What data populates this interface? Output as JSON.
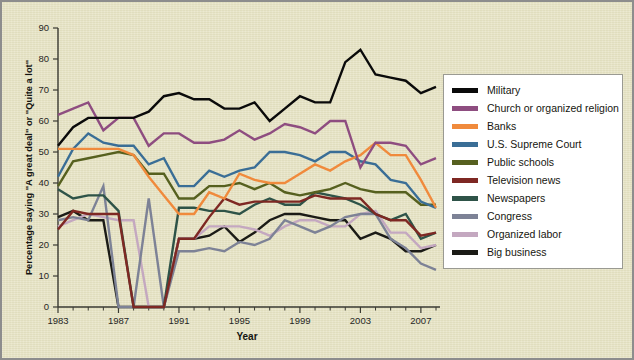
{
  "figure": {
    "background_color": "#e7e4c4",
    "frame_color": "#8d8d8d"
  },
  "chart_data": {
    "type": "line",
    "title": "",
    "xlabel": "Year",
    "ylabel": "Percentage saying \"A great deal\" or \"Quite a lot\"",
    "xlim": [
      1983,
      2008
    ],
    "ylim": [
      0,
      90
    ],
    "ytick_step": 10,
    "yticks": [
      0,
      10,
      20,
      30,
      40,
      50,
      60,
      70,
      80,
      90
    ],
    "xticks_major": [
      1983,
      1987,
      1991,
      1995,
      1999,
      2003,
      2007
    ],
    "xticks_minor_step": 1,
    "grid": false,
    "legend_position": "right",
    "x": [
      1983,
      1984,
      1985,
      1986,
      1987,
      1988,
      1989,
      1990,
      1991,
      1992,
      1993,
      1994,
      1995,
      1996,
      1997,
      1998,
      1999,
      2000,
      2001,
      2002,
      2003,
      2004,
      2005,
      2006,
      2007,
      2008
    ],
    "series": [
      {
        "name": "Military",
        "color": "#0a0a0a",
        "values": [
          52,
          58,
          61,
          61,
          61,
          61,
          63,
          68,
          69,
          67,
          67,
          64,
          64,
          66,
          60,
          64,
          68,
          66,
          66,
          79,
          83,
          75,
          74,
          73,
          69,
          71
        ]
      },
      {
        "name": "Church or organized religion",
        "color": "#8e4d80",
        "values": [
          62,
          64,
          66,
          57,
          61,
          61,
          52,
          56,
          56,
          53,
          53,
          54,
          57,
          54,
          56,
          59,
          58,
          56,
          60,
          60,
          45,
          53,
          53,
          52,
          46,
          48
        ]
      },
      {
        "name": "Banks",
        "color": "#f08a3c",
        "values": [
          51,
          51,
          51,
          51,
          51,
          49,
          42,
          36,
          30,
          30,
          37,
          35,
          43,
          41,
          40,
          40,
          43,
          46,
          44,
          47,
          49,
          53,
          49,
          49,
          41,
          32
        ]
      },
      {
        "name": "U.S. Supreme Court",
        "color": "#3a6e96",
        "values": [
          42,
          51,
          56,
          53,
          52,
          52,
          46,
          48,
          39,
          39,
          44,
          42,
          44,
          45,
          50,
          50,
          49,
          47,
          50,
          50,
          47,
          46,
          41,
          40,
          34,
          32
        ]
      },
      {
        "name": "Public schools",
        "color": "#56601f",
        "values": [
          39,
          47,
          48,
          49,
          50,
          49,
          43,
          43,
          35,
          35,
          39,
          39,
          40,
          38,
          40,
          37,
          36,
          37,
          38,
          40,
          38,
          37,
          37,
          37,
          33,
          33
        ]
      },
      {
        "name": "Television news",
        "color": "#7e2823",
        "values": [
          25,
          31,
          30,
          30,
          30,
          0,
          0,
          0,
          22,
          22,
          29,
          35,
          33,
          34,
          34,
          34,
          34,
          36,
          35,
          35,
          35,
          30,
          28,
          28,
          23,
          24
        ]
      },
      {
        "name": "Newspapers",
        "color": "#2e5348",
        "values": [
          38,
          35,
          36,
          36,
          31,
          0,
          0,
          0,
          32,
          32,
          31,
          31,
          30,
          33,
          35,
          33,
          33,
          37,
          36,
          35,
          33,
          30,
          28,
          30,
          22,
          24
        ]
      },
      {
        "name": "Congress",
        "color": "#7d8296",
        "values": [
          28,
          29,
          28,
          39,
          0,
          0,
          35,
          0,
          18,
          18,
          19,
          18,
          21,
          20,
          22,
          28,
          26,
          24,
          26,
          29,
          30,
          30,
          22,
          19,
          14,
          12
        ]
      },
      {
        "name": "Organized labor",
        "color": "#c4a8c0",
        "values": [
          26,
          28,
          30,
          29,
          28,
          28,
          0,
          0,
          22,
          22,
          26,
          26,
          26,
          25,
          23,
          26,
          28,
          28,
          26,
          26,
          30,
          31,
          24,
          24,
          19,
          20
        ]
      },
      {
        "name": "Big business",
        "color": "#1b1b16",
        "values": [
          29,
          31,
          28,
          28,
          0,
          0,
          0,
          0,
          22,
          22,
          23,
          26,
          21,
          24,
          28,
          30,
          30,
          29,
          28,
          28,
          22,
          24,
          22,
          18,
          18,
          20
        ]
      }
    ]
  },
  "legend": {
    "items": [
      {
        "label": "Military",
        "color": "#0a0a0a"
      },
      {
        "label": "Church or organized religion",
        "color": "#8e4d80"
      },
      {
        "label": "Banks",
        "color": "#f08a3c"
      },
      {
        "label": "U.S. Supreme Court",
        "color": "#3a6e96"
      },
      {
        "label": "Public schools",
        "color": "#56601f"
      },
      {
        "label": "Television news",
        "color": "#7e2823"
      },
      {
        "label": "Newspapers",
        "color": "#2e5348"
      },
      {
        "label": "Congress",
        "color": "#7d8296"
      },
      {
        "label": "Organized labor",
        "color": "#c4a8c0"
      },
      {
        "label": "Big business",
        "color": "#1b1b16"
      }
    ]
  }
}
